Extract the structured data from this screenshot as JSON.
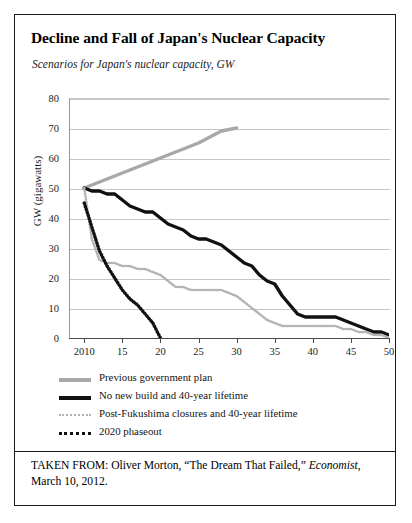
{
  "figure": {
    "title": "Decline and Fall of Japan's Nuclear Capacity",
    "subtitle": "Scenarios for Japan's nuclear capacity, GW",
    "source_prefix": "TAKEN FROM: Oliver Morton, “The Dream That Failed,” ",
    "source_italic": "Economist",
    "source_suffix": ", March 10, 2012."
  },
  "legend": [
    {
      "label": "Previous government plan",
      "color": "#a8a8a8",
      "style": "solid",
      "swatch": "legend-swatch-previous-plan"
    },
    {
      "label": "No new build and 40-year lifetime",
      "color": "#111111",
      "style": "solid",
      "swatch": "legend-swatch-no-new-build"
    },
    {
      "label": "Post-Fukushima closures and 40-year lifetime",
      "color": "#b4b4b4",
      "style": "dotted",
      "swatch": "legend-swatch-post-fukushima"
    },
    {
      "label": "2020 phaseout",
      "color": "#111111",
      "style": "dotted",
      "swatch": "legend-swatch-2020-phaseout"
    }
  ],
  "chart_data": {
    "type": "line",
    "title": "Decline and Fall of Japan's Nuclear Capacity",
    "subtitle": "Scenarios for Japan's nuclear capacity, GW",
    "xlabel": "",
    "ylabel": "GW (gigawatts)",
    "xlim": [
      2008,
      2050
    ],
    "ylim": [
      0,
      80
    ],
    "yticks": [
      0,
      10,
      20,
      30,
      40,
      50,
      60,
      70,
      80
    ],
    "xticks": [
      2010,
      2015,
      2020,
      2025,
      2030,
      2035,
      2040,
      2045,
      2050
    ],
    "xticklabels": [
      "2010",
      "15",
      "20",
      "25",
      "30",
      "35",
      "40",
      "45",
      "50"
    ],
    "grid": "horizontal",
    "legend_position": "below",
    "series": [
      {
        "name": "Previous government plan",
        "color": "#a8a8a8",
        "style": "solid",
        "x": [
          2010,
          2015,
          2020,
          2025,
          2028,
          2030
        ],
        "values": [
          50,
          55,
          60,
          65,
          69,
          70
        ]
      },
      {
        "name": "No new build and 40-year lifetime",
        "color": "#111111",
        "style": "solid",
        "x": [
          2010,
          2011,
          2012,
          2013,
          2014,
          2015,
          2016,
          2017,
          2018,
          2019,
          2020,
          2021,
          2022,
          2023,
          2024,
          2025,
          2026,
          2027,
          2028,
          2029,
          2030,
          2031,
          2032,
          2033,
          2034,
          2035,
          2036,
          2037,
          2038,
          2039,
          2040,
          2041,
          2042,
          2043,
          2044,
          2045,
          2046,
          2047,
          2048,
          2049,
          2050
        ],
        "values": [
          50,
          49,
          49,
          48,
          48,
          46,
          44,
          43,
          42,
          42,
          40,
          38,
          37,
          36,
          34,
          33,
          33,
          32,
          31,
          29,
          27,
          25,
          24,
          21,
          19,
          18,
          14,
          11,
          8,
          7,
          7,
          7,
          7,
          7,
          6,
          5,
          4,
          3,
          2,
          2,
          1
        ]
      },
      {
        "name": "Post-Fukushima closures and 40-year lifetime",
        "color": "#b4b4b4",
        "style": "dotted",
        "x": [
          2010,
          2011,
          2012,
          2013,
          2014,
          2015,
          2016,
          2017,
          2018,
          2019,
          2020,
          2021,
          2022,
          2023,
          2024,
          2025,
          2026,
          2027,
          2028,
          2029,
          2030,
          2031,
          2032,
          2033,
          2034,
          2035,
          2036,
          2037,
          2038,
          2039,
          2040,
          2041,
          2042,
          2043,
          2044,
          2045,
          2046,
          2047,
          2048,
          2049,
          2050
        ],
        "values": [
          50,
          33,
          26,
          25,
          25,
          24,
          24,
          23,
          23,
          22,
          21,
          19,
          17,
          17,
          16,
          16,
          16,
          16,
          16,
          15,
          14,
          12,
          10,
          8,
          6,
          5,
          4,
          4,
          4,
          4,
          4,
          4,
          4,
          4,
          3,
          3,
          2,
          2,
          1,
          1,
          0
        ]
      },
      {
        "name": "2020 phaseout",
        "color": "#111111",
        "style": "dotted",
        "x": [
          2010,
          2011,
          2012,
          2013,
          2014,
          2015,
          2016,
          2017,
          2018,
          2019,
          2020
        ],
        "values": [
          45,
          37,
          29,
          24,
          20,
          16,
          13,
          11,
          8,
          5,
          0
        ]
      }
    ]
  }
}
